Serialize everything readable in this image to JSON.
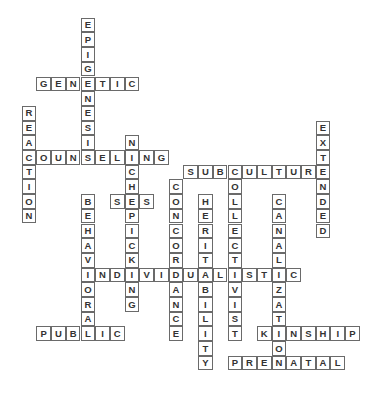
{
  "puzzle": {
    "type": "crossword",
    "cell_size": 14.7,
    "origin": {
      "x": 21.7,
      "y": 17.7
    },
    "words": [
      {
        "word": "EPIGENESIS",
        "dir": "down",
        "row": 0,
        "col": 4
      },
      {
        "word": "GENETIC",
        "dir": "across",
        "row": 4,
        "col": 1
      },
      {
        "word": "REACTION",
        "dir": "down",
        "row": 6,
        "col": 0
      },
      {
        "word": "COUNSELING",
        "dir": "across",
        "row": 9,
        "col": 0
      },
      {
        "word": "NICHEPICKING",
        "dir": "down",
        "row": 8,
        "col": 7
      },
      {
        "word": "EXTENDED",
        "dir": "down",
        "row": 7,
        "col": 20
      },
      {
        "word": "SUBCULTURE",
        "dir": "across",
        "row": 10,
        "col": 11
      },
      {
        "word": "CONCORDANCE",
        "dir": "down",
        "row": 11,
        "col": 10
      },
      {
        "word": "COLLECTIVIST",
        "dir": "down",
        "row": 10,
        "col": 14
      },
      {
        "word": "SES",
        "dir": "across",
        "row": 12,
        "col": 6
      },
      {
        "word": "BEHAVIORAL",
        "dir": "down",
        "row": 12,
        "col": 4
      },
      {
        "word": "HERITABILITY",
        "dir": "down",
        "row": 12,
        "col": 12
      },
      {
        "word": "CANALIZATION",
        "dir": "down",
        "row": 12,
        "col": 17
      },
      {
        "word": "INDIVIDUALISTIC",
        "dir": "across",
        "row": 17,
        "col": 4
      },
      {
        "word": "PUBLIC",
        "dir": "across",
        "row": 21,
        "col": 1
      },
      {
        "word": "KINSHIP",
        "dir": "across",
        "row": 21,
        "col": 16
      },
      {
        "word": "PRENATAL",
        "dir": "across",
        "row": 23,
        "col": 14
      }
    ]
  }
}
